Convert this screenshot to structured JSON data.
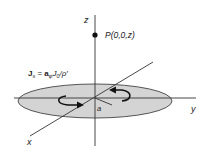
{
  "diagram": {
    "type": "charged-disk-geometry",
    "axes": {
      "x_label": "x",
      "y_label": "y",
      "z_label": "z"
    },
    "point": {
      "label": "P(0,0,z)"
    },
    "radius_label": "a",
    "current_density": {
      "lhs_bold": "J",
      "lhs_sub": "s",
      "eq": " = ",
      "unit_vec_bold": "a",
      "unit_vec_sub": "φ",
      "rhs": "J",
      "rhs_sub": "0",
      "rhs_div": "/ρ′"
    },
    "colors": {
      "disk_fill": "#d4d4d4",
      "disk_stroke": "#555555",
      "axis": "#333333",
      "arrow": "#111111",
      "text": "#222222"
    }
  }
}
